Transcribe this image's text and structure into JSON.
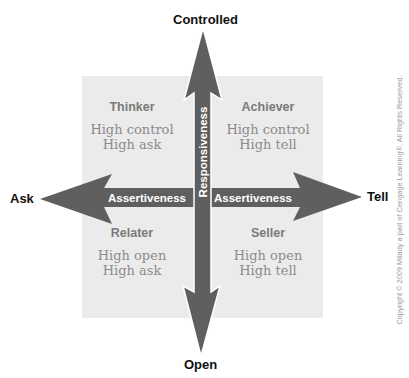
{
  "diagram": {
    "poles": {
      "top": "Controlled",
      "bottom": "Open",
      "left": "Ask",
      "right": "Tell"
    },
    "axes": {
      "vertical_label": "Responsiveness",
      "horizontal_label_left": "Assertiveness",
      "horizontal_label_right": "Assertiveness"
    },
    "quadrants": {
      "top_left": {
        "title": "Thinker",
        "line1": "High control",
        "line2": "High ask"
      },
      "top_right": {
        "title": "Achiever",
        "line1": "High control",
        "line2": "High tell"
      },
      "bottom_left": {
        "title": "Relater",
        "line1": "High open",
        "line2": "High ask"
      },
      "bottom_right": {
        "title": "Seller",
        "line1": "High open",
        "line2": "High tell"
      }
    },
    "copyright": "Copyright © 2009 Milady a part of Cengage Learning®. All Rights Reserved.",
    "colors": {
      "arrow": "#5f5f5f",
      "box": "#ebebeb",
      "quadrant_title": "#7a7a7a",
      "quadrant_text": "#8c8c8c"
    }
  }
}
